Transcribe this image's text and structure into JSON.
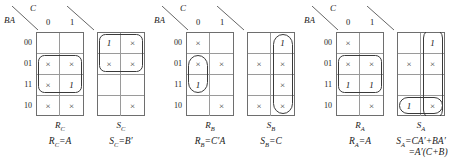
{
  "figure": {
    "type": "karnaugh-maps",
    "variable_header_top": "C",
    "variable_header_side": "BA",
    "column_headers": [
      "0",
      "1"
    ],
    "row_headers": [
      "00",
      "01",
      "11",
      "10"
    ],
    "dont_care_symbol": "×",
    "one_symbol": "1",
    "colors": {
      "grid_outer": "#6e6e6e",
      "grid_inner": "#9a9a9a",
      "group_stroke": "#3a3a3a",
      "text": "#1a1a1a",
      "background": "#ffffff"
    }
  },
  "maps": [
    {
      "id": "rc",
      "name": "R_C",
      "caption": "R",
      "caption_sub": "C",
      "equation": "R",
      "equation_sub": "C",
      "equation_rest": "=A",
      "cells": [
        [
          "",
          ""
        ],
        [
          "×",
          "×"
        ],
        [
          "×",
          "1"
        ],
        [
          "×",
          "×"
        ]
      ],
      "groups": [
        {
          "shape": "rounded-rect",
          "col": 0,
          "row": 1,
          "cols": 2,
          "rows": 2
        }
      ]
    },
    {
      "id": "sc",
      "name": "S_C",
      "caption": "S",
      "caption_sub": "C",
      "equation": "S",
      "equation_sub": "C",
      "equation_rest": "=B′",
      "cells": [
        [
          "1",
          "×"
        ],
        [
          "×",
          "×"
        ],
        [
          "",
          ""
        ],
        [
          "",
          "×"
        ]
      ],
      "groups": [
        {
          "shape": "rounded-rect",
          "col": 0,
          "row": 0,
          "cols": 2,
          "rows": 2
        }
      ]
    },
    {
      "id": "rb",
      "name": "R_B",
      "caption": "R",
      "caption_sub": "B",
      "equation": "R",
      "equation_sub": "B",
      "equation_rest": "=C′A",
      "cells": [
        [
          "×",
          ""
        ],
        [
          "×",
          "×"
        ],
        [
          "1",
          ""
        ],
        [
          "",
          "×"
        ]
      ],
      "groups": [
        {
          "shape": "oval",
          "col": 0,
          "row": 1,
          "cols": 1,
          "rows": 2
        }
      ]
    },
    {
      "id": "sb",
      "name": "S_B",
      "caption": "S",
      "caption_sub": "B",
      "equation": "S",
      "equation_sub": "B",
      "equation_rest": "=C",
      "cells": [
        [
          "",
          "1"
        ],
        [
          "×",
          "×"
        ],
        [
          "",
          "×"
        ],
        [
          "×",
          "×"
        ]
      ],
      "groups": [
        {
          "shape": "oval",
          "col": 1,
          "row": 0,
          "cols": 1,
          "rows": 4
        }
      ]
    },
    {
      "id": "ra",
      "name": "R_A",
      "caption": "R",
      "caption_sub": "A",
      "equation": "R",
      "equation_sub": "A",
      "equation_rest": "=A",
      "cells": [
        [
          "×",
          ""
        ],
        [
          "×",
          "×"
        ],
        [
          "1",
          "1"
        ],
        [
          "",
          "×"
        ]
      ],
      "groups": [
        {
          "shape": "rounded-rect",
          "col": 0,
          "row": 1,
          "cols": 2,
          "rows": 2
        }
      ]
    },
    {
      "id": "sa",
      "name": "S_A",
      "caption": "S",
      "caption_sub": "A",
      "equation": "S",
      "equation_sub": "A",
      "equation_rest": "=CA′+BA′",
      "equation_line2": "=A′(C+B)",
      "cells": [
        [
          "",
          "1"
        ],
        [
          "×",
          "×"
        ],
        [
          "",
          ""
        ],
        [
          "1",
          "×"
        ]
      ],
      "groups": [
        {
          "shape": "oval",
          "col": 0,
          "row": 3,
          "cols": 2,
          "rows": 1
        },
        {
          "shape": "oval-wrap",
          "col": 1,
          "row": 0,
          "cols": 1,
          "rows": 1
        }
      ]
    }
  ]
}
